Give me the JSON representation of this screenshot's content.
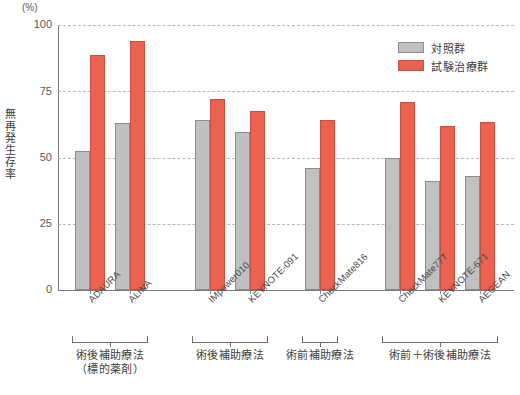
{
  "chart_data": {
    "type": "bar",
    "title": "",
    "xlabel": "",
    "ylabel": "無再発生存率",
    "unit_label": "(%)",
    "ylim": [
      0,
      100
    ],
    "yticks": [
      0,
      25,
      50,
      75,
      100
    ],
    "ytick_labels": [
      "0",
      "25",
      "50",
      "75",
      "100"
    ],
    "grid": true,
    "legend_position": "top-right",
    "categories": [
      "ADAURA",
      "ALINA",
      "IMpower010",
      "KEYNOTE-091",
      "CheckMate816",
      "CheckMate77T",
      "KEYNOTE-671",
      "AEGEAN"
    ],
    "series": [
      {
        "name": "対照群",
        "color": "#c0c0c0",
        "values": [
          52.5,
          63.0,
          64.0,
          59.5,
          46.0,
          50.0,
          41.0,
          43.0
        ]
      },
      {
        "name": "試験治療群",
        "color": "#ec6250",
        "values": [
          88.5,
          94.0,
          72.0,
          67.5,
          64.0,
          71.0,
          62.0,
          63.5
        ]
      }
    ],
    "groups": [
      {
        "label": "術後補助療法\n（標的薬剤）",
        "line1": "術後補助療法",
        "line2": "（標的薬剤）",
        "categories": [
          "ADAURA",
          "ALINA"
        ]
      },
      {
        "label": "術後補助療法",
        "line1": "術後補助療法",
        "line2": "",
        "categories": [
          "IMpower010",
          "KEYNOTE-091"
        ]
      },
      {
        "label": "術前補助療法",
        "line1": "術前補助療法",
        "line2": "",
        "categories": [
          "CheckMate816"
        ]
      },
      {
        "label": "術前＋術後補助療法",
        "line1": "術前＋術後補助療法",
        "line2": "",
        "categories": [
          "CheckMate77T",
          "KEYNOTE-671",
          "AEGEAN"
        ]
      }
    ]
  },
  "legend": {
    "items": [
      {
        "label": "対照群",
        "color": "#c0c0c0"
      },
      {
        "label": "試験治療群",
        "color": "#ec6250"
      }
    ]
  },
  "axis": {
    "unit": "(%)",
    "y_title": "無再発生存率",
    "tick_100": "100",
    "tick_75": "75",
    "tick_50": "50",
    "tick_25": "25",
    "tick_0": "0"
  }
}
